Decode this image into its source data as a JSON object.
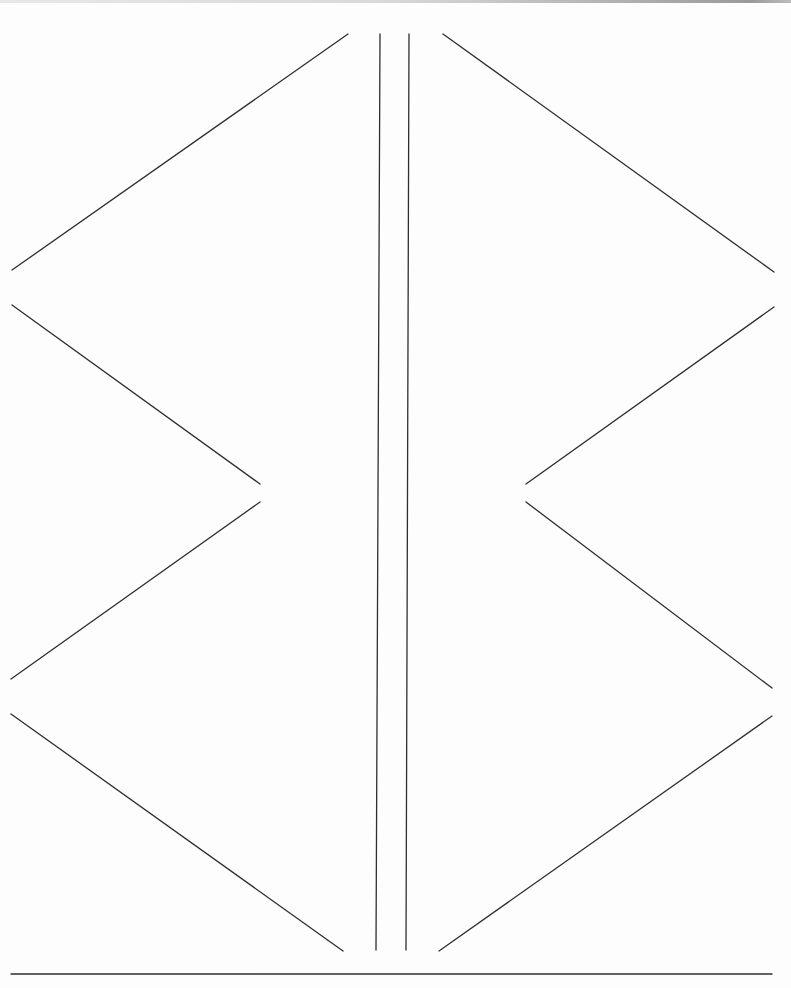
{
  "diagram": {
    "stroke_color": "#2e2e2e",
    "background_color": "#fdfdfd",
    "center_lines": [
      {
        "x1": 380,
        "y1": 34,
        "x2": 376,
        "y2": 950
      },
      {
        "x1": 409,
        "y1": 34,
        "x2": 406,
        "y2": 950
      }
    ],
    "left_strokes": [
      {
        "x1": 348,
        "y1": 34,
        "x2": 12,
        "y2": 270
      },
      {
        "x1": 12,
        "y1": 305,
        "x2": 260,
        "y2": 484
      },
      {
        "x1": 260,
        "y1": 502,
        "x2": 11,
        "y2": 679
      },
      {
        "x1": 11,
        "y1": 714,
        "x2": 343,
        "y2": 951
      }
    ],
    "right_strokes": [
      {
        "x1": 443,
        "y1": 34,
        "x2": 774,
        "y2": 272
      },
      {
        "x1": 774,
        "y1": 307,
        "x2": 526,
        "y2": 484
      },
      {
        "x1": 526,
        "y1": 502,
        "x2": 772,
        "y2": 688
      },
      {
        "x1": 772,
        "y1": 716,
        "x2": 439,
        "y2": 951
      }
    ],
    "base_line": {
      "x1": 11,
      "y1": 974,
      "x2": 772,
      "y2": 974
    }
  }
}
